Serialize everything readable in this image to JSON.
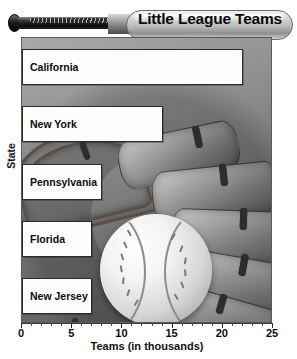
{
  "chart_data": {
    "type": "bar",
    "orientation": "horizontal",
    "title": "Little League Teams",
    "xlabel": "Teams (in thousands)",
    "ylabel": "State",
    "categories": [
      "California",
      "New York",
      "Pennsylvania",
      "Florida",
      "New Jersey"
    ],
    "values": [
      22,
      14,
      8,
      7,
      7
    ],
    "xlim": [
      0,
      25
    ],
    "xticks": [
      0,
      5,
      10,
      15,
      20,
      25
    ],
    "xtick_labels": [
      "0",
      "5",
      "10",
      "15",
      "20",
      "25"
    ],
    "minor_tick_step": 1,
    "grid": false,
    "legend": false,
    "bar_fill": "#fdfdfd",
    "bar_edge": "#2a2a2a",
    "background_theme": "grayscale baseball glove and baseball photograph"
  },
  "decor": {
    "bat_label": "baseball-bat",
    "glove_label": "baseball-glove",
    "ball_label": "baseball"
  }
}
